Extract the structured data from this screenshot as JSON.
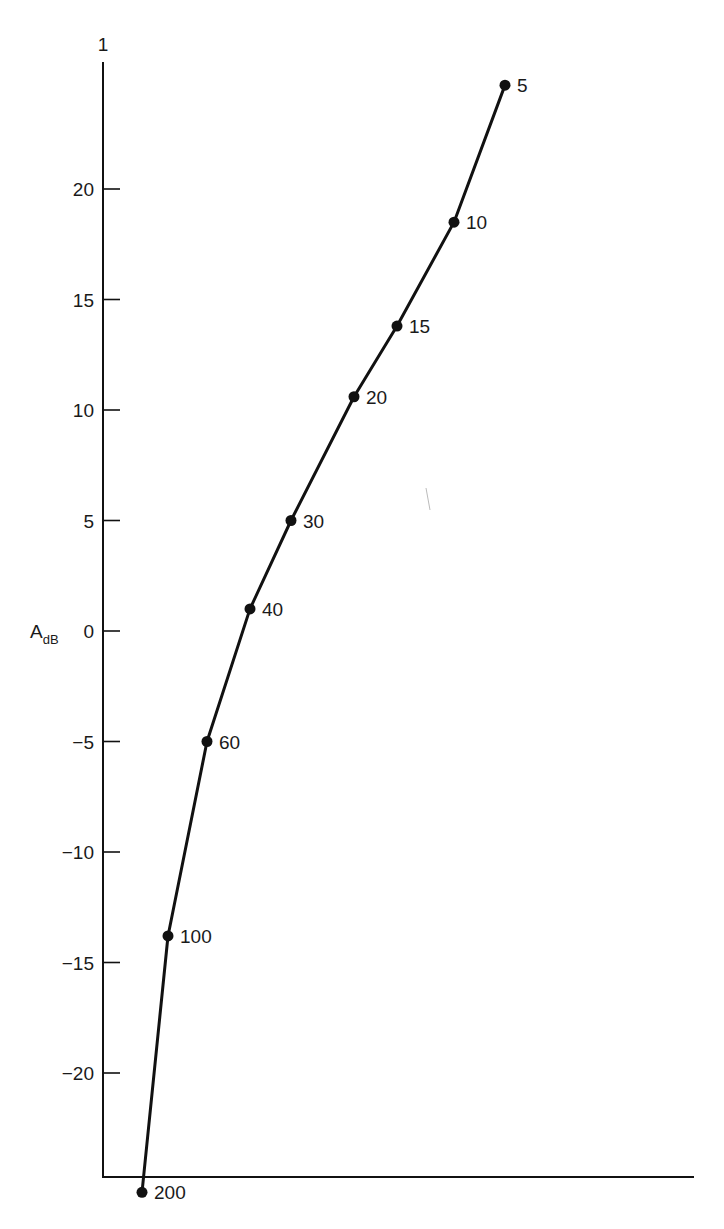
{
  "chart_data": {
    "type": "line",
    "title": "",
    "xlabel": "",
    "ylabel": "A_dB",
    "ylabel_main": "A",
    "ylabel_sub": "dB",
    "y_top_label": "1",
    "ylim": [
      -25.5,
      25.5
    ],
    "yticks": [
      20,
      15,
      10,
      5,
      0,
      -5,
      -10,
      -15,
      -20
    ],
    "ytick_labels": [
      "20",
      "15",
      "10",
      "5",
      "0",
      "−5",
      "−10",
      "−15",
      "−20"
    ],
    "grid": false,
    "legend": null,
    "series": [
      {
        "name": "A_dB vs parameter",
        "point_labels": [
          "5",
          "10",
          "15",
          "20",
          "30",
          "40",
          "60",
          "100",
          "200"
        ],
        "values": [
          24.7,
          18.5,
          13.8,
          10.6,
          5.0,
          1.0,
          -5.0,
          -13.8,
          -25.4
        ],
        "x_pixel_positions": [
          505,
          454,
          397,
          354,
          291,
          250,
          207,
          168,
          142
        ]
      }
    ],
    "annotations": [
      "Point labels give parameter values 5, 10, 15, 20, 30, 40, 60, 100, 200 along the curve"
    ]
  },
  "colors": {
    "ink": "#111111",
    "background": "#ffffff"
  },
  "layout": {
    "axis_x": 103,
    "axis_top_y": 62,
    "axis_bottom_y": 1177,
    "axis_right_x": 694,
    "zero_y": 631,
    "px_per_db": 22.1
  }
}
